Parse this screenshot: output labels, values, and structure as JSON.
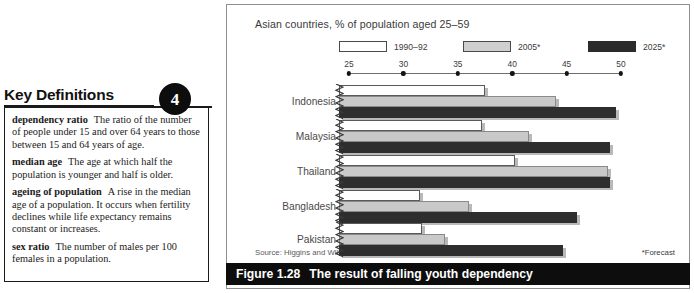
{
  "key_definitions": {
    "title": "Key Definitions",
    "badge": "4",
    "entries": [
      {
        "term": "dependency ratio",
        "definition": "The ratio of the number of people under 15 and over 64 years to those between 15 and 64 years of age."
      },
      {
        "term": "median age",
        "definition": "The age at which half the population is younger and half is older."
      },
      {
        "term": "ageing of population",
        "definition": "A rise in the median age of a population. It occurs when fertility declines while life expectancy remains constant or increases."
      },
      {
        "term": "sex ratio",
        "definition": "The number of males per 100 females in a population."
      }
    ]
  },
  "figure": {
    "number_label": "Figure 1.28",
    "caption": "The result of falling youth dependency",
    "source": "Source: Higgins and Williamson",
    "forecast_note": "*Forecast"
  },
  "colors": {
    "series_1990": "#ffffff",
    "series_2005": "#c9c9c9",
    "series_2025": "#2e2e2e",
    "caption_bar": "#0d0d0d",
    "panel_border": "#8f8f8f",
    "axis": "#6e6e6e"
  },
  "chart_data": {
    "type": "bar",
    "orientation": "horizontal",
    "title": "Asian countries, % of population aged 25–59",
    "xlabel": "",
    "ylabel": "",
    "xlim": [
      25,
      50
    ],
    "xticks": [
      25,
      30,
      35,
      40,
      45,
      50
    ],
    "xticklabels": [
      "25",
      "30",
      "35",
      "40",
      "45",
      "50"
    ],
    "axis_broken_at_origin": true,
    "grid": false,
    "legend_position": "top",
    "categories": [
      "Indonesia",
      "Malaysia",
      "Thailand",
      "Bangladesh",
      "Pakistan"
    ],
    "series": [
      {
        "name": "1990–92",
        "values": [
          37.5,
          37.2,
          40.3,
          31.5,
          31.7
        ]
      },
      {
        "name": "2005*",
        "values": [
          44.0,
          41.5,
          48.8,
          36.0,
          33.8
        ]
      },
      {
        "name": "2025*",
        "values": [
          49.5,
          49.0,
          49.0,
          46.0,
          44.7
        ]
      }
    ]
  }
}
